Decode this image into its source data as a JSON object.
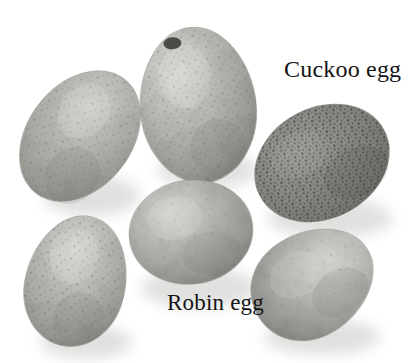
{
  "image": {
    "kind": "photograph",
    "subject": "clutch of bird eggs in a nest",
    "background_color": "#ffffff",
    "width": 414,
    "height": 363
  },
  "labels": [
    {
      "id": "cuckoo",
      "text": "Cuckoo egg",
      "color": "#151515",
      "x": 284,
      "y": 57,
      "font_size": 24
    },
    {
      "id": "robin",
      "text": "Robin egg",
      "color": "#151515",
      "x": 167,
      "y": 291,
      "font_size": 23
    }
  ],
  "eggs": [
    {
      "id": "egg-top-center",
      "name": "robin-egg-top-center",
      "cx": 198,
      "cy": 105,
      "rx": 58,
      "ry": 78,
      "rotate": -6,
      "base_color": "#b6b6b1",
      "highlight_color": "#d6d6d2",
      "shade_color": "#8f8f8b",
      "speckle_color": "#6d6d68",
      "speckle_density": "medium",
      "blotch": {
        "cx": 178,
        "cy": 41,
        "rx": 9,
        "ry": 6,
        "color": "#3a3a37"
      }
    },
    {
      "id": "egg-left-upper",
      "name": "robin-egg-left-upper",
      "cx": 80,
      "cy": 136,
      "rx": 52,
      "ry": 72,
      "rotate": 38,
      "base_color": "#b2b2ad",
      "highlight_color": "#d2d2ce",
      "shade_color": "#8a8a86",
      "speckle_color": "#6a6a65",
      "speckle_density": "medium"
    },
    {
      "id": "egg-cuckoo",
      "name": "cuckoo-egg",
      "cx": 322,
      "cy": 163,
      "rx": 70,
      "ry": 55,
      "rotate": -28,
      "base_color": "#8d8d88",
      "highlight_color": "#a6a6a1",
      "shade_color": "#6b6b66",
      "speckle_color": "#2e2e2b",
      "speckle_density": "very-high"
    },
    {
      "id": "egg-center",
      "name": "robin-egg-center",
      "cx": 191,
      "cy": 232,
      "rx": 62,
      "ry": 52,
      "rotate": -8,
      "base_color": "#b0b0ab",
      "highlight_color": "#cfcfcb",
      "shade_color": "#878783",
      "speckle_color": "#6c6c67",
      "speckle_density": "low"
    },
    {
      "id": "egg-bottom-left",
      "name": "robin-egg-bottom-left",
      "cx": 76,
      "cy": 281,
      "rx": 50,
      "ry": 66,
      "rotate": 14,
      "base_color": "#b4b4af",
      "highlight_color": "#d4d4d0",
      "shade_color": "#8c8c88",
      "speckle_color": "#5f5f5a",
      "speckle_density": "medium"
    },
    {
      "id": "egg-bottom-right",
      "name": "robin-egg-bottom-right",
      "cx": 313,
      "cy": 283,
      "rx": 64,
      "ry": 52,
      "rotate": -32,
      "base_color": "#b1b1ac",
      "highlight_color": "#d0d0cc",
      "shade_color": "#888884",
      "speckle_color": "#6a6a65",
      "speckle_density": "low"
    }
  ]
}
